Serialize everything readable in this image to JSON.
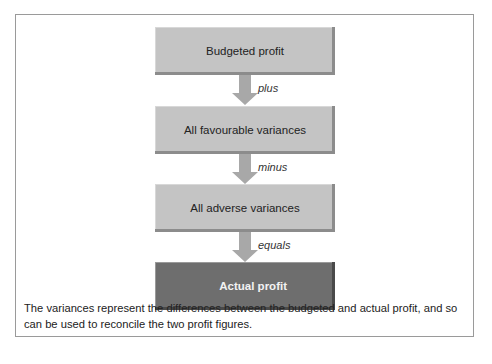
{
  "diagram": {
    "steps": [
      {
        "label": "Budgeted profit",
        "style": "light"
      },
      {
        "label": "All favourable variances",
        "style": "light"
      },
      {
        "label": "All adverse variances",
        "style": "light"
      },
      {
        "label": "Actual profit",
        "style": "dark"
      }
    ],
    "operators": [
      "plus",
      "minus",
      "equals"
    ],
    "caption": "The variances represent the differences between the budgeted and actual profit, and so can be used to reconcile the two profit figures.",
    "colors": {
      "box_fill": "#c4c4c4",
      "box_dark_fill": "#6e6e6e",
      "arrow": "#a8a8a8",
      "frame_border": "#9a9a9a"
    }
  }
}
